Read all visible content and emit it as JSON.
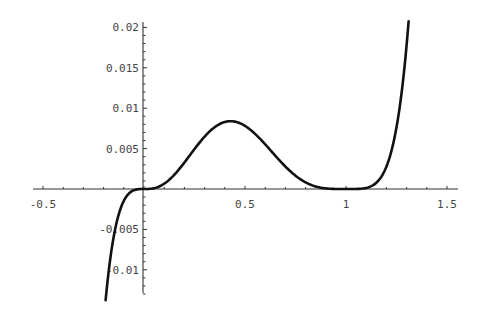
{
  "chart_data": {
    "type": "line",
    "title": "",
    "xlabel": "",
    "ylabel": "",
    "xlim": [
      -0.5,
      1.52
    ],
    "ylim": [
      -0.013,
      0.0205
    ],
    "grid": false,
    "legend": null,
    "x_ticks": [
      {
        "value": -0.5,
        "label": "-0.5"
      },
      {
        "value": 0.5,
        "label": "0.5"
      },
      {
        "value": 1,
        "label": "1"
      },
      {
        "value": 1.5,
        "label": "1.5"
      }
    ],
    "y_ticks": [
      {
        "value": 0.02,
        "label": "0.02"
      },
      {
        "value": 0.015,
        "label": "0.015"
      },
      {
        "value": 0.01,
        "label": "0.01"
      },
      {
        "value": 0.005,
        "label": "0.005"
      },
      {
        "value": -0.005,
        "label": "-0.005"
      },
      {
        "value": -0.01,
        "label": "-0.01"
      }
    ],
    "series": [
      {
        "name": "f(x)",
        "x": [
          -0.19,
          -0.15,
          -0.1,
          -0.05,
          0,
          0.05,
          0.1,
          0.15,
          0.2,
          0.25,
          0.3,
          0.35,
          0.4,
          0.43,
          0.45,
          0.5,
          0.55,
          0.6,
          0.65,
          0.7,
          0.75,
          0.8,
          0.85,
          0.9,
          0.95,
          1.0,
          1.05,
          1.1,
          1.15,
          1.2,
          1.25,
          1.31
        ],
        "values": [
          -0.0097,
          -0.0044,
          -0.0015,
          -0.0002,
          0,
          0.0001,
          0.0007,
          0.0018,
          0.0033,
          0.0049,
          0.0065,
          0.0077,
          0.0083,
          0.0084,
          0.0083,
          0.0078,
          0.0067,
          0.0055,
          0.0041,
          0.0028,
          0.0017,
          0.0008,
          0.0003,
          0.0001,
          0.0,
          0,
          0.0,
          0.0001,
          0.0008,
          0.0028,
          0.0076,
          0.0208
        ]
      }
    ]
  }
}
